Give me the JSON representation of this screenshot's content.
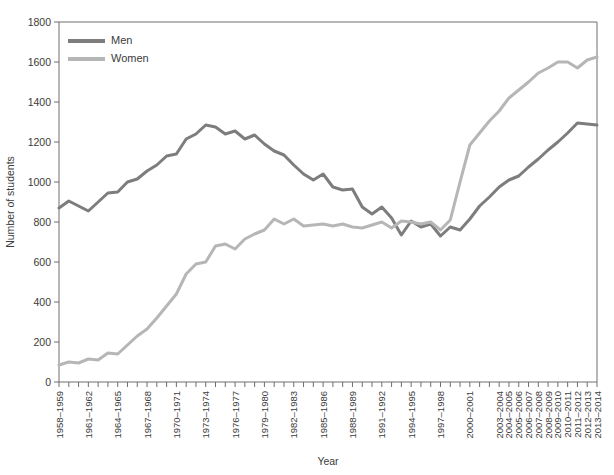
{
  "chart_data": {
    "type": "line",
    "title": "",
    "xlabel": "Year",
    "ylabel": "Number of students",
    "ylim": [
      0,
      1800
    ],
    "ytick_step": 200,
    "yticks": [
      0,
      200,
      400,
      600,
      800,
      1000,
      1200,
      1400,
      1600,
      1800
    ],
    "grid": false,
    "legend_position": "top-left",
    "colors": {
      "men": "#7d7d7d",
      "women": "#b6b6b6",
      "axis": "#6e6e6e",
      "text": "#3b3b3b"
    },
    "categories": [
      "1958-1959",
      "1959-1960",
      "1960-1961",
      "1961-1962",
      "1962-1963",
      "1963-1964",
      "1964-1965",
      "1965-1966",
      "1966-1967",
      "1967-1968",
      "1968-1969",
      "1969-1970",
      "1970-1971",
      "1971-1972",
      "1972-1973",
      "1973-1974",
      "1974-1975",
      "1975-1976",
      "1976-1977",
      "1977-1978",
      "1978-1979",
      "1979-1980",
      "1980-1981",
      "1981-1982",
      "1982-1983",
      "1983-1984",
      "1984-1985",
      "1985-1986",
      "1986-1987",
      "1987-1988",
      "1988-1989",
      "1989-1990",
      "1990-1991",
      "1991-1992",
      "1992-1993",
      "1993-1994",
      "1994-1995",
      "1995-1996",
      "1996-1997",
      "1997-1998",
      "1998-1999",
      "1999-2000",
      "2000-2001",
      "2001-2002",
      "2002-2003",
      "2003-2004",
      "2004-2005",
      "2005-2006",
      "2006-2007",
      "2007-2008",
      "2008-2009",
      "2009-2010",
      "2010-2011",
      "2011-2012",
      "2012-2013",
      "2013-2014"
    ],
    "xtick_labels_shown": [
      "1958-1959",
      "1961-1962",
      "1964-1965",
      "1967-1968",
      "1970-1971",
      "1973-1974",
      "1976-1977",
      "1979-1980",
      "1982-1983",
      "1985-1986",
      "1988-1989",
      "1991-1992",
      "1994-1995",
      "1997-1998",
      "2000-2001",
      "2003-2004",
      "2004-2005",
      "2005-2006",
      "2006-2007",
      "2007-2008",
      "2008-2009",
      "2009-2010",
      "2010-2011",
      "2011-2012",
      "2012-2013",
      "2013-2014"
    ],
    "series": [
      {
        "name": "Men",
        "color": "#7d7d7d",
        "values": [
          870,
          905,
          880,
          855,
          900,
          945,
          950,
          1000,
          1015,
          1055,
          1085,
          1130,
          1140,
          1215,
          1240,
          1285,
          1275,
          1240,
          1255,
          1215,
          1235,
          1190,
          1155,
          1135,
          1085,
          1040,
          1010,
          1040,
          975,
          960,
          965,
          875,
          840,
          875,
          820,
          735,
          805,
          775,
          790,
          730,
          775,
          760,
          815,
          880,
          925,
          975,
          1010,
          1030,
          1075,
          1115,
          1160,
          1200,
          1245,
          1295,
          1290,
          1285
        ]
      },
      {
        "name": "Women",
        "color": "#b6b6b6",
        "values": [
          85,
          100,
          95,
          115,
          110,
          145,
          140,
          185,
          230,
          265,
          320,
          380,
          440,
          540,
          590,
          600,
          680,
          690,
          665,
          715,
          740,
          760,
          815,
          790,
          815,
          780,
          785,
          790,
          780,
          790,
          775,
          770,
          785,
          800,
          770,
          805,
          800,
          790,
          800,
          760,
          810,
          1000,
          1185,
          1245,
          1305,
          1355,
          1420,
          1460,
          1500,
          1545,
          1570,
          1600,
          1600,
          1570,
          1610,
          1625
        ]
      }
    ]
  },
  "legend": {
    "items": [
      {
        "label": "Men"
      },
      {
        "label": "Women"
      }
    ]
  },
  "axes": {
    "x_title": "Year",
    "y_title": "Number of students"
  }
}
